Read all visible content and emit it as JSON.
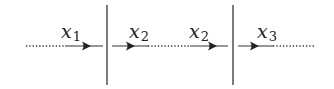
{
  "diagram": {
    "colors": {
      "line": "#333333",
      "wall": "#444444",
      "label": "#222222",
      "background": "#ffffff"
    },
    "baseline_y": 46,
    "walls": [
      {
        "x": 107,
        "y1": 5,
        "y2": 85
      },
      {
        "x": 233,
        "y1": 5,
        "y2": 85
      }
    ],
    "segments": [
      {
        "style": "dotted",
        "x1": 26,
        "x2": 65
      },
      {
        "style": "solid",
        "x1": 65,
        "x2": 103
      },
      {
        "style": "solid",
        "x1": 112,
        "x2": 148
      },
      {
        "style": "dotted",
        "x1": 148,
        "x2": 190
      },
      {
        "style": "solid",
        "x1": 190,
        "x2": 228
      },
      {
        "style": "solid",
        "x1": 238,
        "x2": 273
      },
      {
        "style": "dotted",
        "x1": 273,
        "x2": 315
      }
    ],
    "arrows": [
      {
        "tip_x": 91,
        "direction": "right"
      },
      {
        "tip_x": 135,
        "direction": "right"
      },
      {
        "tip_x": 217,
        "direction": "right"
      },
      {
        "tip_x": 259,
        "direction": "right"
      }
    ],
    "labels": [
      {
        "var": "x",
        "sub": "1",
        "left": 61,
        "top": 22
      },
      {
        "var": "x",
        "sub": "2",
        "left": 129,
        "top": 22
      },
      {
        "var": "x",
        "sub": "2",
        "left": 189,
        "top": 22
      },
      {
        "var": "x",
        "sub": "3",
        "left": 257,
        "top": 22
      }
    ]
  }
}
